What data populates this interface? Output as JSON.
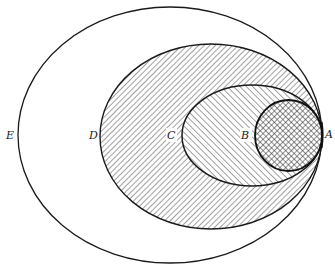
{
  "diagram": {
    "type": "nested-ellipses",
    "colors": {
      "background": "#ffffff",
      "stroke": "#1a1a1a",
      "hatch": "#444444",
      "label": "#222222"
    },
    "regions": [
      {
        "id": "E",
        "label": "E",
        "cx": 170,
        "cy": 135,
        "rx": 152,
        "ry": 128,
        "fill": "none",
        "label_x": 11,
        "label_y": 139
      },
      {
        "id": "D",
        "label": "D",
        "cx": 211,
        "cy": 136.5,
        "rx": 111,
        "ry": 92.5,
        "fill": "hatch-forward",
        "label_x": 93,
        "label_y": 139
      },
      {
        "id": "C",
        "label": "C",
        "cx": 252,
        "cy": 135.5,
        "rx": 70,
        "ry": 50.5,
        "fill": "hatch-backward",
        "label_x": 172,
        "label_y": 139
      },
      {
        "id": "B",
        "label": "B",
        "cx": 288.5,
        "cy": 135.5,
        "rx": 33.5,
        "ry": 35.5,
        "fill": "crosshatch",
        "label_x": 245,
        "label_y": 139
      }
    ],
    "tangent_point": {
      "label": "A",
      "x": 322,
      "y": 135,
      "label_x": 329,
      "label_y": 139
    }
  }
}
